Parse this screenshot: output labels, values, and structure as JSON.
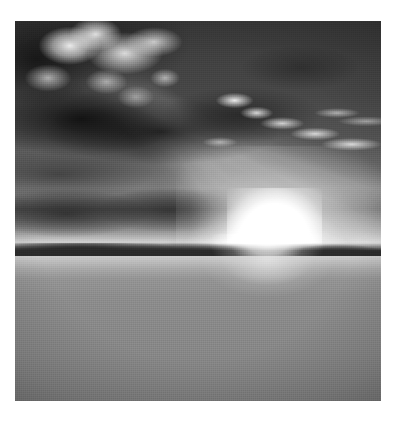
{
  "image": {
    "kind": "photograph",
    "medium": "digital photograph",
    "color_mode": "grayscale",
    "orientation": "portrait",
    "subject": "drought-cracked earth under a dramatic sunset sky",
    "caption": "",
    "alt_text": "Black and white photograph of a vast dry lakebed of cracked mud stretching to a low horizon, beneath a heavy cloudy sky with the sun setting just above the ridgeline and rays fanning upward.",
    "frame": {
      "left": 15,
      "top": 21,
      "width": 366,
      "height": 380,
      "background": "#ffffff"
    },
    "palette": {
      "page_background": "#ffffff",
      "sky_dark": "#3a3a3a",
      "sky_mid": "#6b6b6b",
      "sky_light": "#d8d8d8",
      "cloud_shadow": "#1a1a1a",
      "cloud_highlight": "#ffffff",
      "sun_core": "#ffffff",
      "horizon_ridge": "#2e2e2e",
      "ground_near_horizon": "#a9a9a9",
      "ground_foreground": "#7d7d7d",
      "crack_dark": "#1e1e1e",
      "crack_deep": "#111111"
    },
    "regions": [
      {
        "name": "sky",
        "label": "Overcast sunset sky",
        "vertical_extent_pct": [
          0,
          60.5
        ],
        "description": "Dark storm-grey sky at the top grading to bright pale grey at the horizon."
      },
      {
        "name": "dark-cloud-mass",
        "label": "Heavy dark cloud bank",
        "vertical_extent_pct": [
          0,
          56
        ],
        "description": "Large shadowed cumulus mass filling the upper-left and centre of the frame."
      },
      {
        "name": "sunlit-cloud-tops",
        "label": "Sunlit cumulus tops",
        "vertical_extent_pct": [
          0,
          50
        ],
        "description": "Bright white billowing cloud tops clustered in the upper-left quadrant."
      },
      {
        "name": "cloud-wisps",
        "label": "Backlit wisp clouds",
        "vertical_extent_pct": [
          20,
          55
        ],
        "description": "Thin bright streaks of cloud lit from beneath on the right side."
      },
      {
        "name": "crepuscular-rays",
        "label": "Sun rays",
        "vertical_extent_pct": [
          0,
          60
        ],
        "description": "Faint fan of light beams radiating upward and to the right from the sun."
      },
      {
        "name": "sun",
        "label": "Setting sun",
        "center_pct": [
          68.5,
          59
        ],
        "description": "Blown-out white disc of the sun sitting just above the distant ridge."
      },
      {
        "name": "horizon-ridge",
        "label": "Distant ridgeline",
        "vertical_extent_pct": [
          58.5,
          63
        ],
        "description": "Low dark band of distant land and hills meeting the sky."
      },
      {
        "name": "ground",
        "label": "Dry lakebed",
        "vertical_extent_pct": [
          61.8,
          100
        ],
        "description": "Flat expanse of parched, sun-baked earth receding to the horizon."
      },
      {
        "name": "crack-network",
        "label": "Mud crack polygons",
        "vertical_extent_pct": [
          61.8,
          100
        ],
        "description": "Dense web of dark desiccation cracks dividing the ground into plates that grow larger toward the foreground."
      }
    ]
  }
}
